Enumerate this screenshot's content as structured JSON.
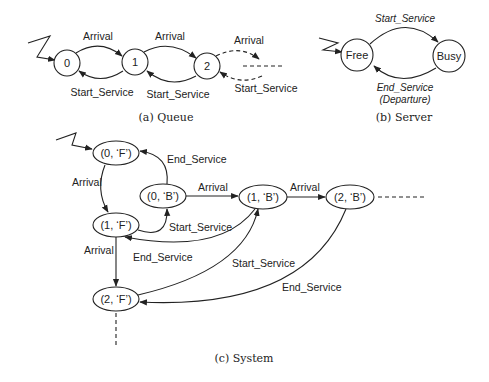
{
  "queue": {
    "states": [
      "0",
      "1",
      "2"
    ],
    "arrival_labels": [
      "Arrival",
      "Arrival",
      "Arrival"
    ],
    "service_labels": [
      "Start_Service",
      "Start_Service",
      "Start_Service"
    ],
    "caption": "(a) Queue"
  },
  "server": {
    "states": [
      "Free",
      "Busy"
    ],
    "start_label": "Start_Service",
    "end_label": "End_Service",
    "end_sub_label": "(Departure)",
    "caption": "(b) Server"
  },
  "system": {
    "states": {
      "s0F": "(0, ‘F’)",
      "s0B": "(0, ‘B’)",
      "s1F": "(1, ‘F’)",
      "s1B": "(1, ‘B’)",
      "s2B": "(2, ‘B’)",
      "s2F": "(2, ‘F’)"
    },
    "labels": {
      "end_service_0": "End_Service",
      "arrival_0F_1F": "Arrival",
      "arrival_0B_1B": "Arrival",
      "arrival_1B_2B": "Arrival",
      "start_service_1F_0B": "Start_Service",
      "arrival_1F_2F": "Arrival",
      "end_service_1B_1F": "End_Service",
      "start_service_2F_1B": "Start_Service",
      "end_service_2B_2F": "End_Service"
    },
    "caption": "(c) System"
  }
}
